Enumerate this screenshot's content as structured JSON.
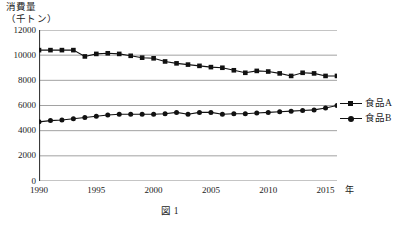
{
  "chart_data": {
    "type": "line",
    "title": "",
    "ylabel_line1": "消費量",
    "ylabel_line2": "（千トン）",
    "xlabel": "年",
    "caption": "図 1",
    "ylim": [
      0,
      12000
    ],
    "xlim": [
      1990,
      2016
    ],
    "ytick_labels": [
      "12000",
      "10000",
      "8000",
      "6000",
      "4000",
      "2000",
      "0"
    ],
    "yticks": [
      12000,
      10000,
      8000,
      6000,
      4000,
      2000,
      0
    ],
    "xtick_labels": [
      "1990",
      "1995",
      "2000",
      "2005",
      "2010",
      "2015"
    ],
    "xticks": [
      1990,
      1995,
      2000,
      2005,
      2010,
      2015
    ],
    "grid": "horizontal",
    "legend_position": "right",
    "x": [
      1990,
      1991,
      1992,
      1993,
      1994,
      1995,
      1996,
      1997,
      1998,
      1999,
      2000,
      2001,
      2002,
      2003,
      2004,
      2005,
      2006,
      2007,
      2008,
      2009,
      2010,
      2011,
      2012,
      2013,
      2014,
      2015,
      2016
    ],
    "series": [
      {
        "name": "食品A",
        "marker": "square",
        "color": "#111111",
        "values": [
          10400,
          10400,
          10400,
          10400,
          9900,
          10100,
          10150,
          10100,
          9950,
          9800,
          9750,
          9500,
          9350,
          9250,
          9150,
          9050,
          9000,
          8800,
          8600,
          8750,
          8700,
          8550,
          8350,
          8600,
          8550,
          8350,
          8350
        ]
      },
      {
        "name": "食品B",
        "marker": "circle",
        "color": "#111111",
        "values": [
          4700,
          4800,
          4850,
          4950,
          5050,
          5150,
          5250,
          5300,
          5300,
          5300,
          5300,
          5350,
          5450,
          5300,
          5450,
          5450,
          5300,
          5350,
          5350,
          5400,
          5450,
          5500,
          5550,
          5600,
          5650,
          5800,
          6000
        ]
      }
    ]
  },
  "legend": {
    "items": [
      {
        "label": "食品A",
        "marker": "square"
      },
      {
        "label": "食品B",
        "marker": "circle"
      }
    ]
  }
}
